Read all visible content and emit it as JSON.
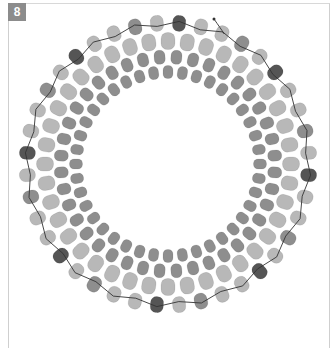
{
  "step_badge": {
    "label": "8",
    "color": "#8c8c8c"
  },
  "diagram": {
    "type": "beadwork-ring",
    "center": [
      168,
      164
    ],
    "colors": {
      "dark": "#555555",
      "medium": "#8e8e8e",
      "light": "#b8b8b8",
      "thread": "#333333"
    },
    "rows": [
      {
        "name": "inner-row",
        "radius": 92,
        "count": 40,
        "bead_w": 10,
        "bead_h": 13,
        "color": "medium",
        "offset": 0
      },
      {
        "name": "second-row",
        "radius": 107,
        "count": 40,
        "bead_w": 11,
        "bead_h": 14,
        "color": "medium",
        "offset": 4.5
      },
      {
        "name": "large-row",
        "radius": 123,
        "count": 40,
        "bead_w": 14,
        "bead_h": 17,
        "color": "light",
        "offset": 0
      },
      {
        "name": "outer-row",
        "radius": 141,
        "count": 40,
        "bead_w": 13,
        "bead_h": 16,
        "color": "pattern",
        "offset": 4.5,
        "pattern": [
          "dark",
          "light",
          "light",
          "medium",
          "light"
        ]
      }
    ],
    "thread_end": {
      "x": 214,
      "y": 19
    }
  }
}
